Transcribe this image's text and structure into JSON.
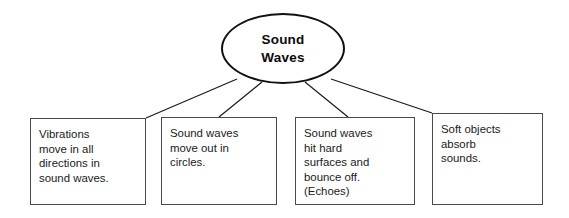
{
  "diagram": {
    "type": "concept-map",
    "background_color": "#ffffff",
    "line_color": "#111111",
    "box_border_color": "#4a4a4a",
    "root": {
      "shape": "ellipse",
      "lines": [
        "Sound",
        "Waves"
      ],
      "text": "Sound Waves"
    },
    "branches": [
      {
        "id": "vibrations",
        "lines": [
          "Vibrations",
          "move in all",
          "directions in",
          "sound waves."
        ],
        "text": "Vibrations move in all directions in sound waves."
      },
      {
        "id": "circles",
        "lines": [
          "Sound waves",
          "move out in",
          "circles."
        ],
        "text": "Sound waves move out in circles."
      },
      {
        "id": "echoes",
        "lines": [
          "Sound waves",
          "hit hard",
          "surfaces and",
          "bounce off.",
          "(Echoes)"
        ],
        "text": "Sound waves hit hard surfaces and bounce off. (Echoes)"
      },
      {
        "id": "absorb",
        "lines": [
          "Soft objects",
          "absorb",
          "sounds."
        ],
        "text": "Soft objects absorb sounds."
      }
    ]
  }
}
